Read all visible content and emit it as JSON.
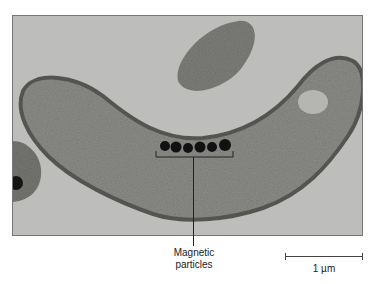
{
  "figure": {
    "particle_count": 6,
    "colors": {
      "background": "#bdbdbb",
      "cell": "#8a8a86",
      "particles": "#111111"
    }
  },
  "annotation": {
    "line1": "Magnetic",
    "line2": "particles"
  },
  "scale_bar": {
    "label": "1 µm"
  }
}
